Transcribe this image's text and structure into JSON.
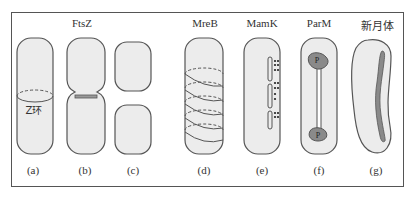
{
  "diagram": {
    "headers": [
      {
        "text": "FtsZ",
        "x": 82,
        "y": 20
      },
      {
        "text": "MreB",
        "x": 205,
        "y": 20
      },
      {
        "text": "MamK",
        "x": 262,
        "y": 20
      },
      {
        "text": "ParM",
        "x": 319,
        "y": 20
      },
      {
        "text": "新月体",
        "x": 377,
        "y": 20
      }
    ],
    "annotations": [
      {
        "text": "Z环",
        "x": 33,
        "y": 104
      }
    ],
    "panel_labels": [
      {
        "text": "(a)",
        "x": 33,
        "y": 166
      },
      {
        "text": "(b)",
        "x": 84,
        "y": 166
      },
      {
        "text": "(c)",
        "x": 133,
        "y": 166
      },
      {
        "text": "(d)",
        "x": 205,
        "y": 166
      },
      {
        "text": "(e)",
        "x": 262,
        "y": 166
      },
      {
        "text": "(f)",
        "x": 319,
        "y": 166
      },
      {
        "text": "(g)",
        "x": 377,
        "y": 166
      }
    ],
    "protein_labels": {
      "parm_pole": "P"
    },
    "colors": {
      "cell_fill": "#ececec",
      "cell_stroke": "#555555",
      "filament_fill": "#8a8a8a",
      "dot": "#222222"
    }
  }
}
